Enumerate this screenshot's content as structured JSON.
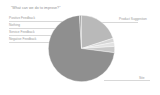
{
  "chart_data": {
    "type": "pie",
    "title": "\"What can we do to improve?\"",
    "xlabel": "",
    "ylabel": "",
    "legend_position": "callout-labels",
    "grid": false,
    "categories": [
      "Product Suggestion",
      "Positive Feedback",
      "Nothing",
      "Service Feedback",
      "Negative Feedback",
      "Site"
    ],
    "values": [
      20,
      2,
      2,
      3,
      72,
      1
    ],
    "colors": [
      "#b9b9b9",
      "#d6d6d6",
      "#e2e2e2",
      "#c9c9c9",
      "#8f8f8f",
      "#a8a8a8"
    ],
    "labels": {
      "left": [
        "Positive Feedback",
        "Nothing",
        "Service Feedback",
        "Negative Feedback"
      ],
      "right": [
        "Product Suggestion",
        "Site"
      ]
    }
  },
  "canvas": {
    "background": "#ffffff",
    "text_color": "#9a9a9a",
    "leader_color": "#d8d8d8"
  }
}
